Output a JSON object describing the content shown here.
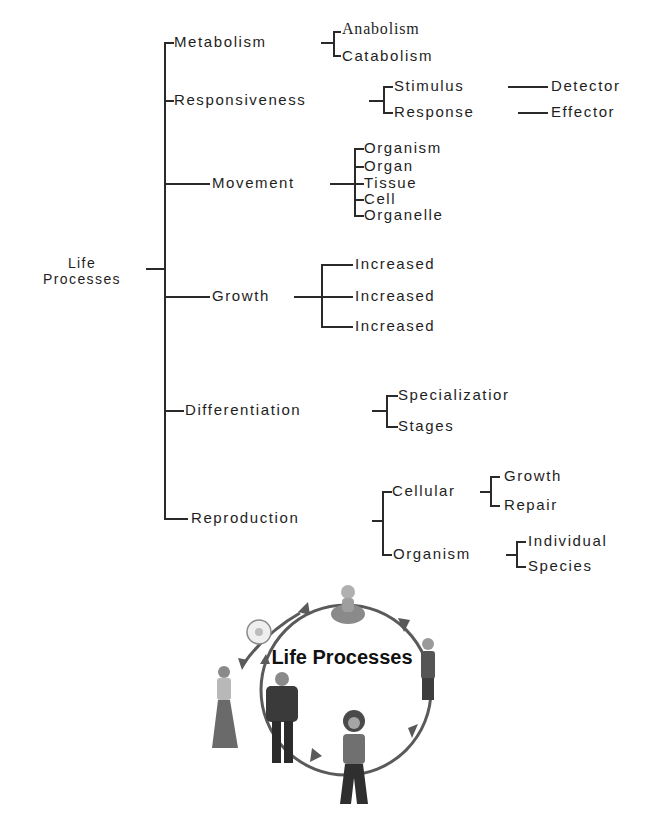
{
  "diagram": {
    "root": {
      "line1": "Life",
      "line2": "Processes"
    },
    "branches": [
      {
        "label": "Metabolism",
        "children": [
          {
            "label": "Anabolism"
          },
          {
            "label": "Catabolism"
          }
        ]
      },
      {
        "label": "Responsiveness",
        "children": [
          {
            "label": "Stimulus",
            "children": [
              {
                "label": "Detector"
              }
            ]
          },
          {
            "label": "Response",
            "children": [
              {
                "label": "Effector"
              }
            ]
          }
        ]
      },
      {
        "label": "Movement",
        "children": [
          {
            "label": "Organism"
          },
          {
            "label": "Organ"
          },
          {
            "label": "Tissue"
          },
          {
            "label": "Cell"
          },
          {
            "label": "Organelle"
          }
        ]
      },
      {
        "label": "Growth",
        "children": [
          {
            "label": "Increased"
          },
          {
            "label": "Increased"
          },
          {
            "label": "Increased"
          }
        ]
      },
      {
        "label": "Differentiation",
        "children": [
          {
            "label": "Specializatior"
          },
          {
            "label": "Stages"
          }
        ]
      },
      {
        "label": "Reproduction",
        "children": [
          {
            "label": "Cellular",
            "children": [
              {
                "label": "Growth"
              },
              {
                "label": "Repair"
              }
            ]
          },
          {
            "label": "Organism",
            "children": [
              {
                "label": "Individual"
              },
              {
                "label": "Species"
              }
            ]
          }
        ]
      }
    ]
  },
  "illustration": {
    "title": "Life Processes",
    "stages": [
      "egg-cell",
      "baby",
      "child",
      "teenager",
      "adult-man",
      "adult-woman"
    ],
    "colors": {
      "line": "#5a5a5a",
      "figure": "#6e6e6e",
      "dark": "#333333"
    }
  }
}
